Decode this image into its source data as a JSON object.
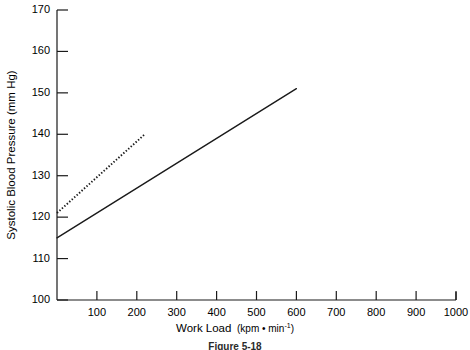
{
  "chart_data": {
    "type": "line",
    "title": "",
    "xlabel": "Work Load (kpm•min⁻¹)",
    "xlabel_main": "Work Load",
    "xlabel_unit": "(kpm • min",
    "xlabel_unit_sup": "-1",
    "xlabel_unit_close": ")",
    "ylabel": "Systolic Blood Pressure (mm Hg)",
    "xlim": [
      0,
      1000
    ],
    "ylim": [
      100,
      170
    ],
    "xticks": [
      100,
      200,
      300,
      400,
      500,
      600,
      700,
      800,
      900,
      1000
    ],
    "xtick_labels": [
      "100",
      "200",
      "300",
      "400",
      "500",
      "600",
      "700",
      "800",
      "900",
      "1000"
    ],
    "yticks": [
      100,
      110,
      120,
      130,
      140,
      150,
      160,
      170
    ],
    "ytick_labels": [
      "100",
      "110",
      "120",
      "130",
      "140",
      "150",
      "160",
      "170"
    ],
    "grid": false,
    "legend": "none",
    "series": [
      {
        "name": "solid-line",
        "style": "solid",
        "color": "#1a1a1a",
        "x": [
          0,
          600
        ],
        "values": [
          115,
          151
        ]
      },
      {
        "name": "dotted-line",
        "style": "dotted",
        "color": "#1a1a1a",
        "x": [
          0,
          220
        ],
        "values": [
          121,
          140
        ]
      }
    ]
  },
  "caption": {
    "text": "Figure 5-18"
  },
  "axes": {
    "x_axis_name": "work-load-axis",
    "y_axis_name": "systolic-blood-pressure-axis"
  }
}
